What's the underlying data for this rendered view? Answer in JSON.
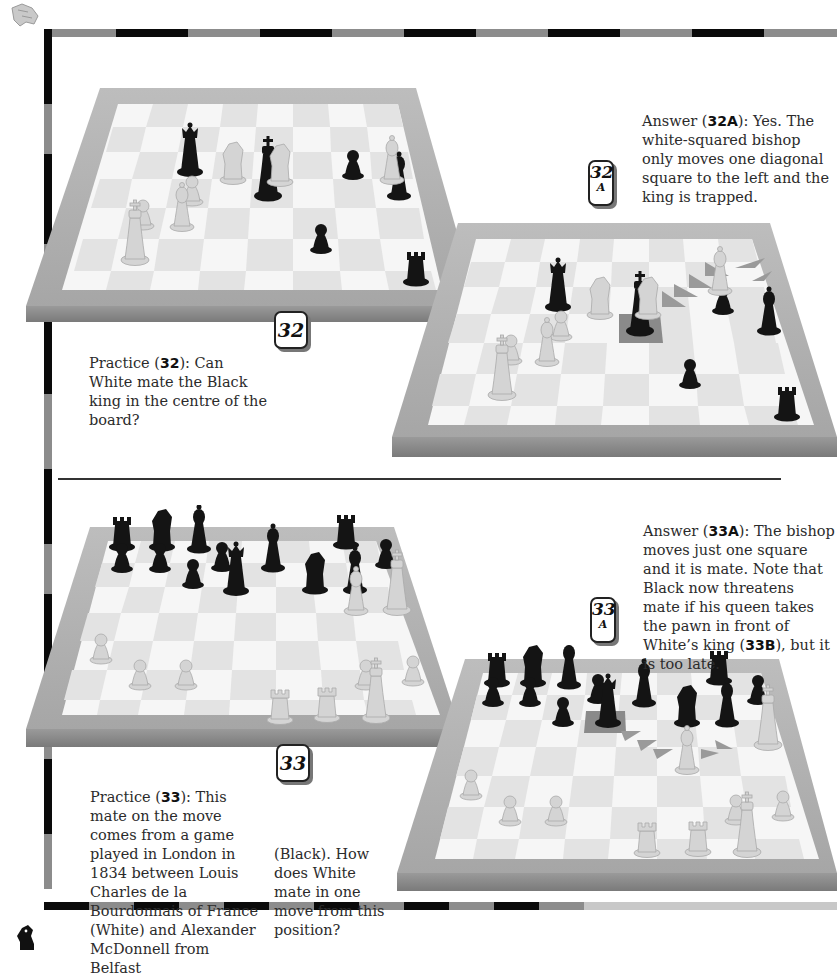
{
  "page": {
    "corner_icons": {
      "top_left": "white-knight-icon",
      "bottom_left": "black-knight-icon"
    },
    "frame": {
      "dark": "#0a0a0a",
      "light": "#8c8c8c"
    }
  },
  "section_32": {
    "practice": {
      "badge": "32",
      "label": "Practice",
      "ref": "32",
      "text_before": "Practice (",
      "text_after": "): Can White mate the Black king in the centre of the board?"
    },
    "answer": {
      "badge_number": "32",
      "badge_sub": "A",
      "label": "Answer",
      "ref": "32A",
      "text_before": "Answer (",
      "text_after": "): Yes. The white-squared bishop only moves one diagonal square to the left and the king is trapped."
    }
  },
  "section_33": {
    "practice": {
      "badge": "33",
      "ref": "33",
      "text_before": "Practice (",
      "text_after": "): This mate on the move comes from a game played in London in 1834 between Louis Charles de la Bourdonnais of France (White) and Alexander McDonnell from Belfast",
      "text_continued": "(Black). How does White mate in one move from this position?"
    },
    "answer": {
      "badge_number": "33",
      "badge_sub": "A",
      "ref": "33A",
      "ref_b": "33B",
      "text_before": "Answer (",
      "text_mid": "): The bishop moves just one square and it is mate. Note that Black now threatens mate if his queen takes the pawn in front of White’s king (",
      "text_after": "), but it is too late."
    }
  },
  "boards": {
    "b32": {
      "caption": "Board 32",
      "highlight": null
    },
    "b32a": {
      "caption": "Board 32A",
      "highlight": "king-square"
    },
    "b33": {
      "caption": "Board 33",
      "highlight": null
    },
    "b33a": {
      "caption": "Board 33A",
      "highlight": "king-square"
    }
  }
}
